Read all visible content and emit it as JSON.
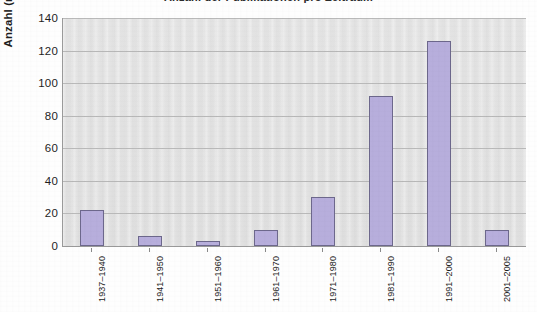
{
  "chart_data": {
    "type": "bar",
    "title": "Anzahl der Publikationen pro Zeitraum",
    "xlabel": "",
    "ylabel": "Anzahl (n=292)",
    "categories": [
      "1937–1940",
      "1941–1950",
      "1951–1960",
      "1961–1970",
      "1971–1980",
      "1981–1990",
      "1991–2000",
      "2001–2005"
    ],
    "values": [
      22,
      6,
      3,
      10,
      30,
      92,
      126,
      10
    ],
    "ylim": [
      0,
      140
    ],
    "yticks": [
      0,
      20,
      40,
      60,
      80,
      100,
      120,
      140
    ],
    "ytick_labels": [
      "0",
      "20",
      "40",
      "60",
      "80",
      "100",
      "120",
      "140"
    ],
    "grid": "horizontal",
    "legend": "none",
    "series": [
      {
        "name": "Anzahl",
        "values": [
          22,
          6,
          3,
          10,
          30,
          92,
          126,
          10
        ]
      }
    ],
    "colors": {
      "bar_fill": "#b7aedc",
      "bar_border": "#6d688c",
      "plot_background": "#e2e2e2",
      "grid_line": "#b9b9b9",
      "axis_line": "#9a9a9a",
      "text": "#1c1c1c",
      "page_background": "#fefefe"
    }
  }
}
